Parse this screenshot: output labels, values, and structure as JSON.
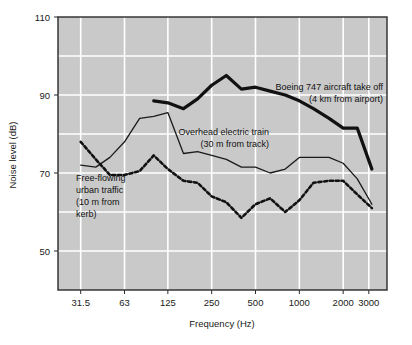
{
  "chart_data": {
    "type": "line",
    "title": "",
    "xlabel": "Frequency (Hz)",
    "ylabel": "Noise level (dB)",
    "xscale": "log",
    "xtick_labels": [
      "31.5",
      "63",
      "125",
      "250",
      "500",
      "1000",
      "2000",
      "3000"
    ],
    "xtick_values": [
      31.5,
      63,
      125,
      250,
      500,
      1000,
      2000,
      3000
    ],
    "ytick_labels": [
      "50",
      "70",
      "90",
      "110"
    ],
    "ytick_values": [
      50,
      70,
      90,
      110
    ],
    "ylim": [
      40,
      110
    ],
    "xlim": [
      22,
      4000
    ],
    "grid": true,
    "grid_color": "#ffffff",
    "plot_background": "#c9c9c9",
    "legend_position": "inline-annotations",
    "series": [
      {
        "name": "Boeing 747 aircraft take off",
        "sublabel": "(4 km from airport)",
        "style": "thick-solid",
        "color": "#111111",
        "x": [
          100,
          125,
          160,
          200,
          250,
          315,
          400,
          500,
          630,
          800,
          1000,
          1250,
          1600,
          2000,
          2500,
          3150
        ],
        "y": [
          88.5,
          88.0,
          86.5,
          89.0,
          92.5,
          95.0,
          91.5,
          92.0,
          91.0,
          90.0,
          88.5,
          86.5,
          84.0,
          81.5,
          81.5,
          71.0
        ]
      },
      {
        "name": "Overhead electric train",
        "sublabel": "(30 m from track)",
        "style": "thin-solid",
        "color": "#1a1a1a",
        "x": [
          31.5,
          40,
          50,
          63,
          80,
          100,
          125,
          160,
          200,
          250,
          315,
          400,
          500,
          630,
          800,
          1000,
          1250,
          1600,
          2000,
          2500,
          3150
        ],
        "y": [
          72.0,
          71.5,
          74.0,
          78.0,
          84.0,
          84.5,
          85.5,
          75.0,
          75.5,
          74.5,
          73.5,
          71.5,
          71.5,
          70.0,
          71.0,
          74.0,
          74.0,
          74.0,
          72.5,
          68.5,
          62.0
        ]
      },
      {
        "name": "Free-flowing urban traffic",
        "sublabel": "(10 m from kerb)",
        "style": "dotted",
        "color": "#111111",
        "x": [
          31.5,
          40,
          50,
          63,
          80,
          100,
          125,
          160,
          200,
          250,
          315,
          400,
          500,
          630,
          800,
          1000,
          1250,
          1600,
          2000,
          2500,
          3150
        ],
        "y": [
          78.0,
          73.5,
          69.5,
          69.5,
          70.5,
          74.5,
          71.0,
          68.0,
          67.5,
          64.0,
          62.5,
          58.5,
          62.0,
          63.5,
          60.0,
          63.0,
          67.5,
          68.0,
          68.0,
          64.5,
          61.0
        ]
      }
    ],
    "annotations": [
      {
        "id": "boeing",
        "lines": [
          "Boeing 747 aircraft take off",
          "(4 km from airport)"
        ],
        "align": "right"
      },
      {
        "id": "train",
        "lines": [
          "Overhead electric train",
          "(30 m from track)"
        ],
        "align": "right"
      },
      {
        "id": "traffic",
        "lines": [
          "Free-flowing",
          "urban traffic",
          "(10 m from",
          "kerb)"
        ],
        "align": "left"
      }
    ]
  }
}
